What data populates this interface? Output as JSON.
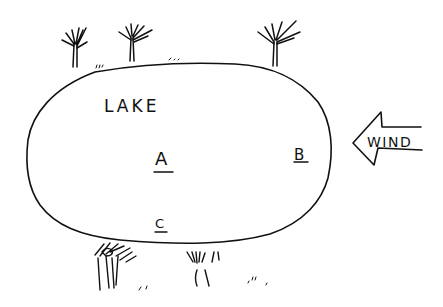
{
  "diagram": {
    "type": "hand-drawn sketch",
    "lake": {
      "label": "LAKE",
      "shape": "oval",
      "bounds": {
        "left": 27,
        "top": 63,
        "right": 330,
        "bottom": 245
      }
    },
    "points": [
      {
        "id": "A",
        "label": "A",
        "underlined": true,
        "x": 163,
        "y": 165
      },
      {
        "id": "B",
        "label": "B",
        "underlined": true,
        "x": 302,
        "y": 160
      },
      {
        "id": "C",
        "label": "C",
        "underlined": true,
        "x": 161,
        "y": 230
      }
    ],
    "wind": {
      "label": "WIND",
      "direction": "left",
      "arrow_tip": {
        "x": 352,
        "y": 145
      }
    },
    "trees": {
      "north_shore": [
        {
          "x": 75
        },
        {
          "x": 132
        },
        {
          "x": 275
        }
      ],
      "south_shore": [
        {
          "x": 110
        },
        {
          "x": 200
        }
      ]
    },
    "colors": {
      "ink": "#111111",
      "background": "#ffffff"
    }
  }
}
